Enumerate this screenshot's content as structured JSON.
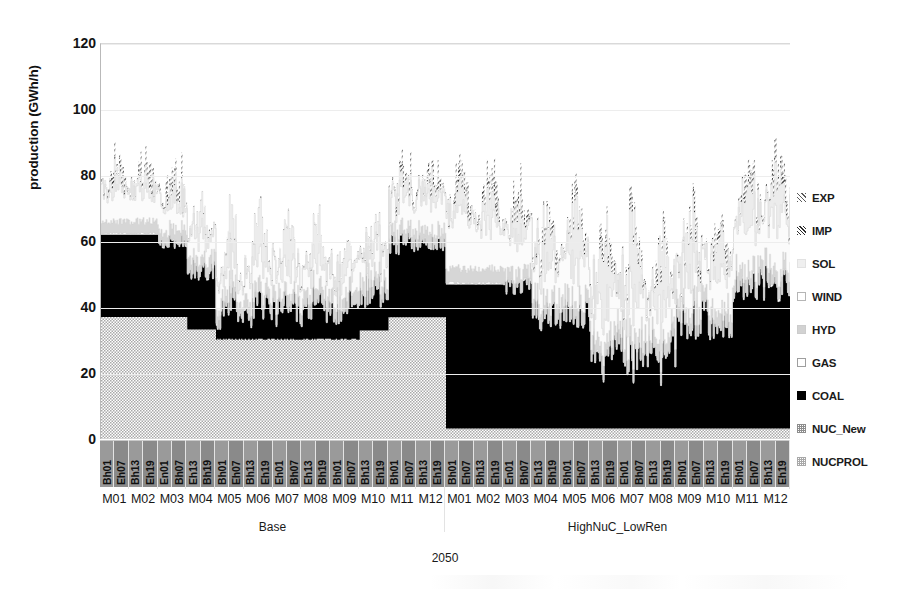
{
  "chart_data": {
    "type": "area",
    "title": "",
    "ylabel": "production (GWh/h)",
    "xlabel": "",
    "ylim": [
      0,
      120
    ],
    "yticks": [
      0,
      20,
      40,
      60,
      80,
      100,
      120
    ],
    "grid": true,
    "legend_position": "right",
    "legend": [
      "EXP",
      "IMP",
      "SOL",
      "WIND",
      "HYD",
      "GAS",
      "COAL",
      "NUC_New",
      "NUCPROL"
    ],
    "series": [
      {
        "name": "NUCPROL",
        "fill": "checker-light"
      },
      {
        "name": "NUC_New",
        "fill": "checker-gray"
      },
      {
        "name": "COAL",
        "fill": "#000000"
      },
      {
        "name": "GAS",
        "fill": "#ffffff"
      },
      {
        "name": "HYD",
        "fill": "#d2d2d2"
      },
      {
        "name": "WIND",
        "fill": "#ffffff"
      },
      {
        "name": "SOL",
        "fill": "#efefef"
      },
      {
        "name": "IMP",
        "fill": "hatch-dark"
      },
      {
        "name": "EXP",
        "fill": "hatch-light"
      }
    ],
    "groups": [
      {
        "label": "Base",
        "year": "2050"
      },
      {
        "label": "HighNuC_LowRen",
        "year": "2050"
      }
    ],
    "months": [
      "M01",
      "M02",
      "M03",
      "M04",
      "M05",
      "M06",
      "M07",
      "M08",
      "M09",
      "M10",
      "M11",
      "M12"
    ],
    "hour_labels": [
      "Bh01",
      "Eh07",
      "Bh13",
      "Eh19",
      "En01",
      "Bh07",
      "Eh13",
      "Bh19",
      "Bh01",
      "Eh07",
      "Bh13",
      "Eh19",
      "Eh01",
      "Bh07",
      "Eh13",
      "Bh19",
      "Bh01",
      "Eh07",
      "Bh13",
      "Eh19",
      "Bh01",
      "Eh07",
      "Bh13",
      "Eh19",
      "Bh01",
      "Eh07",
      "Bh13",
      "Eh19",
      "En01",
      "Bh07",
      "Eh13",
      "Bh19",
      "Bh01",
      "Eh07",
      "Bh13",
      "Eh19",
      "Eh01",
      "Bh07",
      "Eh13",
      "Bh19",
      "Bh01",
      "Eh07",
      "Bh13",
      "Eh19",
      "Bh01",
      "Eh07",
      "Bh13",
      "Eh19"
    ]
  },
  "axis": {
    "y_title": "production (GWh/h)",
    "y_tick_labels": [
      "120",
      "100",
      "80",
      "60",
      "40",
      "20",
      "0"
    ]
  },
  "year_label": "2050"
}
